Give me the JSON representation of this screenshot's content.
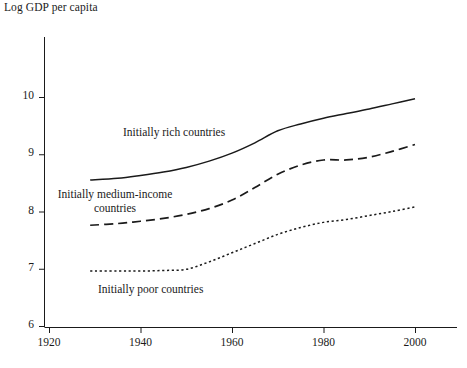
{
  "chart_data": {
    "type": "line",
    "title": "Log GDP per capita",
    "xlabel": "",
    "ylabel": "Log GDP per capita",
    "xlim": [
      1920,
      2005
    ],
    "ylim": [
      6,
      10.6
    ],
    "xticks": [
      1920,
      1940,
      1960,
      1980,
      2000
    ],
    "xtick_labels": [
      "1920",
      "1940",
      "1960",
      "1980",
      "2000"
    ],
    "yticks": [
      6,
      7,
      8,
      9,
      10
    ],
    "ytick_labels": [
      "6",
      "7",
      "8",
      "9",
      "10"
    ],
    "grid": false,
    "legend_position": "inline-annotations",
    "line_color": "#1a1a1a",
    "series": [
      {
        "name": "Initially rich countries",
        "style": "solid",
        "annotation": "Initially rich countries",
        "x": [
          1929,
          1935,
          1940,
          1945,
          1950,
          1955,
          1960,
          1965,
          1970,
          1975,
          1980,
          1985,
          1990,
          1995,
          2000
        ],
        "values": [
          8.55,
          8.58,
          8.63,
          8.69,
          8.77,
          8.88,
          9.02,
          9.2,
          9.41,
          9.53,
          9.63,
          9.71,
          9.79,
          9.88,
          9.97
        ]
      },
      {
        "name": "Initially medium-income countries",
        "style": "dashed",
        "annotation": "Initially medium-income countries",
        "x": [
          1929,
          1935,
          1940,
          1945,
          1950,
          1955,
          1960,
          1965,
          1970,
          1975,
          1980,
          1985,
          1990,
          1995,
          2000
        ],
        "values": [
          7.76,
          7.79,
          7.83,
          7.88,
          7.95,
          8.05,
          8.2,
          8.42,
          8.65,
          8.81,
          8.9,
          8.9,
          8.95,
          9.05,
          9.17
        ]
      },
      {
        "name": "Initially poor countries",
        "style": "dotted",
        "annotation": "Initially poor countries",
        "x": [
          1929,
          1935,
          1940,
          1945,
          1950,
          1955,
          1960,
          1965,
          1970,
          1975,
          1980,
          1985,
          1990,
          1995,
          2000
        ],
        "values": [
          6.96,
          6.96,
          6.96,
          6.97,
          6.99,
          7.12,
          7.28,
          7.44,
          7.6,
          7.72,
          7.81,
          7.86,
          7.93,
          8.0,
          8.08
        ]
      }
    ],
    "annotations": [
      {
        "text": "Initially rich countries",
        "x_px": 183,
        "y_px": 133
      },
      {
        "text": "Initially medium-income\ncountries",
        "x_px": 112,
        "y_px": 203
      },
      {
        "text": "Initially poor countries",
        "x_px": 163,
        "y_px": 291
      }
    ]
  },
  "labels": {
    "rich": "Initially rich countries",
    "medium_line1": "Initially medium-income",
    "medium_line2": "countries",
    "poor": "Initially poor countries"
  }
}
